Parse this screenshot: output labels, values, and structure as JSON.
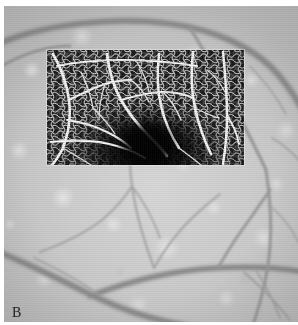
{
  "figure": {
    "panel_label": "B",
    "modality": "retinal-fundus-with-octa-inset",
    "width_px": 298,
    "height_px": 325
  },
  "colors": {
    "page_background": "#ffffff",
    "fundus_base": "#cccccc",
    "fundus_light_mottle": "#e6e6e6",
    "fundus_vessel_dark": "#8f8f8f",
    "fundus_vessel_darkest": "#7a7a7a",
    "octa_background": "#0d0d0d",
    "octa_faz_dark": "#000000",
    "octa_vessel_bright": "#f2f2f2",
    "label_color": "#1c1c1c"
  },
  "fundus": {
    "name": "fundus-photograph",
    "description": "Grayscale retinal fundus photograph showing mottled choroidal background and branching retinal vessels",
    "bounds": {
      "x": 4,
      "y": 6,
      "width": 294,
      "height": 316
    },
    "vessels": [
      {
        "name": "superior-arcade-vessel",
        "caliber": "large",
        "path": "M -6 38 C 40 18, 110 10, 168 18 C 210 24, 246 40, 268 62 C 282 76, 292 92, 300 106"
      },
      {
        "name": "superior-temporal-branch",
        "caliber": "medium",
        "path": "M 186 22 C 200 44, 214 70, 228 96 C 240 120, 252 142, 262 164"
      },
      {
        "name": "superior-left-branch",
        "caliber": "medium",
        "path": "M -6 62 C 18 48, 44 40, 66 40"
      },
      {
        "name": "temporal-descending-vessel",
        "caliber": "medium",
        "path": "M 262 164 C 266 190, 268 216, 266 242 C 264 268, 258 292, 250 316"
      },
      {
        "name": "inferior-arcade-vessel",
        "caliber": "large",
        "path": "M -6 246 C 26 258, 60 276, 94 292 C 128 308, 164 318, 200 322"
      },
      {
        "name": "inferior-horizontal-vessel",
        "caliber": "large",
        "path": "M 86 290 C 128 274, 172 264, 214 262 C 248 260, 278 262, 302 266"
      },
      {
        "name": "inferior-ascending-branch-1",
        "caliber": "thin",
        "path": "M 150 262 C 142 240, 134 216, 130 192 C 127 176, 126 164, 126 154"
      },
      {
        "name": "inferior-ascending-branch-2",
        "caliber": "thin",
        "path": "M 150 262 C 160 244, 172 228, 186 214 C 198 202, 208 194, 216 188"
      },
      {
        "name": "inferior-right-branch",
        "caliber": "medium",
        "path": "M 214 262 C 224 244, 236 226, 248 210 C 256 198, 262 190, 266 184"
      },
      {
        "name": "inferior-far-right-branch",
        "caliber": "thin",
        "path": "M 240 266 C 256 280, 272 296, 286 314"
      },
      {
        "name": "left-mid-thin-branch",
        "caliber": "thin",
        "path": "M 36 246 C 58 238, 80 228, 98 214 C 112 202, 122 190, 128 180"
      },
      {
        "name": "left-lower-thin-branch",
        "caliber": "thin",
        "path": "M 30 252 C 52 262, 74 274, 94 288"
      },
      {
        "name": "right-upper-thin-branch",
        "caliber": "thin",
        "path": "M 268 132 C 282 140, 292 150, 300 160"
      },
      {
        "name": "central-thin-branch",
        "caliber": "thin",
        "path": "M 128 180 C 140 196, 150 214, 156 232"
      }
    ]
  },
  "octa_inset": {
    "name": "octa-angiography-inset",
    "description": "Superficial capillary plexus OCT-angiography en-face image overlaid on the fundus photograph",
    "bounds": {
      "x": 47,
      "y": 50,
      "width": 197,
      "height": 115
    },
    "foveal_avascular_zone": {
      "name": "foveal-avascular-zone",
      "center_rel": {
        "x": 0.51,
        "y": 0.85
      },
      "size_rel": {
        "width": 0.3,
        "height": 0.44
      }
    },
    "major_vessels": [
      {
        "name": "octa-vessel-left-arcade",
        "path": "M 6 4 C 14 18, 20 34, 22 50 C 24 66, 22 82, 16 98 C 12 106, 8 112, 4 116"
      },
      {
        "name": "octa-vessel-left-branch-a",
        "path": "M 22 50 C 34 44, 46 38, 58 34 C 68 31, 76 30, 84 30"
      },
      {
        "name": "octa-vessel-left-branch-b",
        "path": "M 20 70 C 34 72, 48 76, 60 82 C 70 87, 78 92, 84 98"
      },
      {
        "name": "octa-vessel-mid-descending",
        "path": "M 60 4 C 62 20, 66 36, 74 50 C 82 64, 92 76, 102 86 C 110 94, 116 100, 120 106"
      },
      {
        "name": "octa-vessel-mid-arcade",
        "path": "M 74 50 C 88 46, 102 42, 116 42 C 128 42, 138 44, 146 48"
      },
      {
        "name": "octa-vessel-center-right",
        "path": "M 112 4 C 110 22, 110 40, 114 56 C 118 72, 124 86, 132 98"
      },
      {
        "name": "octa-vessel-right-arcade",
        "path": "M 146 2 C 144 20, 144 40, 148 58 C 152 76, 158 92, 164 104"
      },
      {
        "name": "octa-vessel-right-outer",
        "path": "M 176 2 C 178 22, 180 44, 180 66 C 180 86, 178 102, 176 114"
      },
      {
        "name": "octa-vessel-right-branch",
        "path": "M 180 66 C 186 74, 190 84, 192 94"
      },
      {
        "name": "octa-vessel-upper-horizontal",
        "path": "M 10 16 C 30 12, 52 10, 74 10 C 100 10, 126 12, 150 16"
      },
      {
        "name": "octa-vessel-lower-left-horizontal",
        "path": "M 4 92 C 24 90, 44 90, 62 94 C 76 97, 88 102, 98 108"
      }
    ]
  }
}
